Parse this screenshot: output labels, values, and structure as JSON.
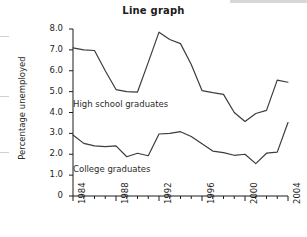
{
  "chart_data": {
    "type": "line",
    "title": "Line graph",
    "xlabel": "",
    "ylabel": "Percentage unemployed",
    "xlim": [
      1984,
      2004
    ],
    "ylim": [
      0,
      8.0
    ],
    "grid": false,
    "legend_position": "inline-annotation",
    "y_ticks": [
      "8.0",
      "7.0",
      "6.0",
      "5.0",
      "4.0",
      "3.0",
      "2.0",
      "1.0",
      "0"
    ],
    "y_tick_values": [
      8.0,
      7.0,
      6.0,
      5.0,
      4.0,
      3.0,
      2.0,
      1.0,
      0
    ],
    "x_ticks": [
      "1984",
      "1988",
      "1992",
      "1996",
      "2000",
      "2004"
    ],
    "x_tick_values": [
      1984,
      1988,
      1992,
      1996,
      2000,
      2004
    ],
    "x_minor_ticks": [
      1985,
      1986,
      1987,
      1989,
      1990,
      1991,
      1993,
      1994,
      1995,
      1997,
      1998,
      1999,
      2001,
      2002,
      2003
    ],
    "x": [
      1984,
      1985,
      1986,
      1987,
      1988,
      1989,
      1990,
      1991,
      1992,
      1993,
      1994,
      1995,
      1996,
      1997,
      1998,
      1999,
      2000,
      2001,
      2002,
      2003,
      2004
    ],
    "series": [
      {
        "name": "High school graduates",
        "color": "#3c3c3c",
        "values": [
          7.1,
          7.0,
          6.97,
          6.0,
          5.1,
          5.0,
          4.98,
          6.4,
          7.85,
          7.5,
          7.3,
          6.3,
          5.05,
          4.95,
          4.87,
          4.0,
          3.57,
          3.95,
          4.1,
          5.55,
          5.45
        ]
      },
      {
        "name": "College graduates",
        "color": "#3c3c3c",
        "values": [
          2.92,
          2.52,
          2.4,
          2.37,
          2.4,
          1.88,
          2.05,
          1.93,
          2.97,
          3.0,
          3.08,
          2.85,
          2.5,
          2.15,
          2.08,
          1.95,
          2.0,
          1.55,
          2.05,
          2.1,
          3.52
        ]
      }
    ],
    "annotations": [
      {
        "text": "High school graduates",
        "x": 1985.0,
        "y": 4.25
      },
      {
        "text": "College graduates",
        "x": 1985.0,
        "y": 1.52
      }
    ],
    "series_tail": {
      "note": "college line final segment descends to 3.12 at right edge"
    },
    "colors": {
      "line": "#3c3c3c",
      "axis": "#1d1d1d",
      "text": "#1d1d1d",
      "background": "#ffffff",
      "edge_strip": "#cfcfcf"
    }
  }
}
